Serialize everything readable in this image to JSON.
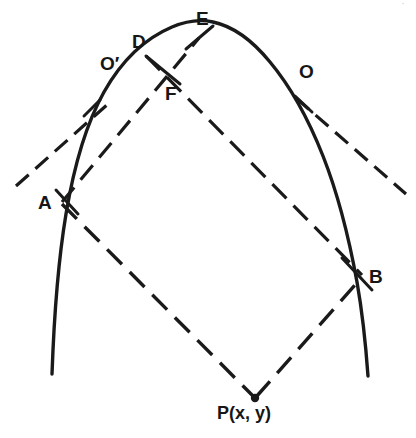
{
  "figure": {
    "kind": "geometry-diagram",
    "canvas": {
      "width": 416,
      "height": 438,
      "background": "#ffffff"
    },
    "ink_color": "#1a1a1a",
    "points": [
      {
        "id": "A",
        "label": "A",
        "x": 61,
        "y": 203,
        "label_x": 38,
        "label_y": 193,
        "role": "tangent-point-left"
      },
      {
        "id": "B",
        "label": "B",
        "x": 363,
        "y": 276,
        "label_x": 369,
        "label_y": 267,
        "role": "tangent-point-right"
      },
      {
        "id": "D",
        "label": "D",
        "x": 145,
        "y": 55,
        "label_x": 132,
        "label_y": 32,
        "role": "curve-point"
      },
      {
        "id": "E",
        "label": "E",
        "x": 200,
        "y": 36,
        "label_x": 196,
        "label_y": 9,
        "role": "curve-point"
      },
      {
        "id": "F",
        "label": "F",
        "x": 178,
        "y": 80,
        "label_x": 165,
        "label_y": 84,
        "role": "chord-intersection"
      },
      {
        "id": "O",
        "label": "O",
        "x": 307,
        "y": 86,
        "label_x": 299,
        "label_y": 62,
        "role": "curve-point-right"
      },
      {
        "id": "Op",
        "label": "O′",
        "x": 120,
        "y": 74,
        "label_x": 100,
        "label_y": 54,
        "role": "curve-point-left"
      },
      {
        "id": "P",
        "label": "P(x, y)",
        "x": 255,
        "y": 398,
        "label_x": 217,
        "label_y": 404,
        "role": "external-point"
      }
    ],
    "segments": [
      {
        "id": "AP",
        "from": "A",
        "to": "P",
        "style": "dashed"
      },
      {
        "id": "PB",
        "from": "P",
        "to": "B",
        "style": "dashed"
      },
      {
        "id": "AE",
        "from": "A",
        "to": "E",
        "style": "dashed"
      },
      {
        "id": "DB",
        "from": "D",
        "to": "B",
        "style": "dashed"
      },
      {
        "id": "DF",
        "from": "D",
        "to": "F",
        "style": "solid"
      },
      {
        "id": "tangent-left",
        "from": "A",
        "to": "upper-left",
        "style": "dashed"
      },
      {
        "id": "tangent-right",
        "from": "B",
        "to": "lower-right",
        "style": "dashed"
      }
    ],
    "curve": {
      "name": "parabola",
      "vertex": {
        "x": 212,
        "y": 22
      },
      "left_end": {
        "x": 52,
        "y": 374
      },
      "right_end": {
        "x": 368,
        "y": 376
      },
      "style": "solid"
    },
    "corner_mark": "·"
  }
}
